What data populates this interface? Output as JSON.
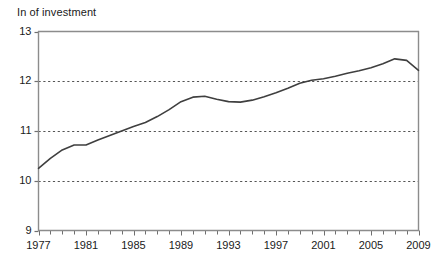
{
  "chart_data": {
    "type": "line",
    "title_display": "In of investment",
    "xlabel": "",
    "ylabel": "",
    "xlim": [
      1977,
      2009
    ],
    "ylim": [
      9,
      13
    ],
    "grid": true,
    "legend": false,
    "legend_position": "none",
    "line_color": "#3f3f3f",
    "grid_color": "#555555",
    "axis_color": "#8c8c8c",
    "y_ticks": [
      9,
      10,
      11,
      12,
      13
    ],
    "y_tick_labels": [
      "9",
      "10",
      "11",
      "12",
      "13"
    ],
    "x_ticks": [
      1977,
      1981,
      1985,
      1989,
      1993,
      1997,
      2001,
      2005,
      2009
    ],
    "x_tick_labels": [
      "1977",
      "1981",
      "1985",
      "1989",
      "1993",
      "1997",
      "2001",
      "2005",
      "2009"
    ],
    "x_minor_tick_step": 1,
    "x": [
      1977,
      1978,
      1979,
      1980,
      1981,
      1982,
      1983,
      1984,
      1985,
      1986,
      1987,
      1988,
      1989,
      1990,
      1991,
      1992,
      1993,
      1994,
      1995,
      1996,
      1997,
      1998,
      1999,
      2000,
      2001,
      2002,
      2003,
      2004,
      2005,
      2006,
      2007,
      2008,
      2009
    ],
    "values": [
      10.25,
      10.45,
      10.62,
      10.72,
      10.72,
      10.82,
      10.91,
      11.0,
      11.09,
      11.17,
      11.29,
      11.43,
      11.59,
      11.68,
      11.7,
      11.64,
      11.59,
      11.58,
      11.62,
      11.69,
      11.77,
      11.86,
      11.96,
      12.02,
      12.05,
      12.1,
      12.16,
      12.21,
      12.27,
      12.35,
      12.45,
      12.42,
      12.22
    ],
    "series": [
      {
        "name": "ln of investment",
        "values": [
          10.25,
          10.45,
          10.62,
          10.72,
          10.72,
          10.82,
          10.91,
          11.0,
          11.09,
          11.17,
          11.29,
          11.43,
          11.59,
          11.68,
          11.7,
          11.64,
          11.59,
          11.58,
          11.62,
          11.69,
          11.77,
          11.86,
          11.96,
          12.02,
          12.05,
          12.1,
          12.16,
          12.21,
          12.27,
          12.35,
          12.45,
          12.42,
          12.22
        ]
      }
    ]
  }
}
